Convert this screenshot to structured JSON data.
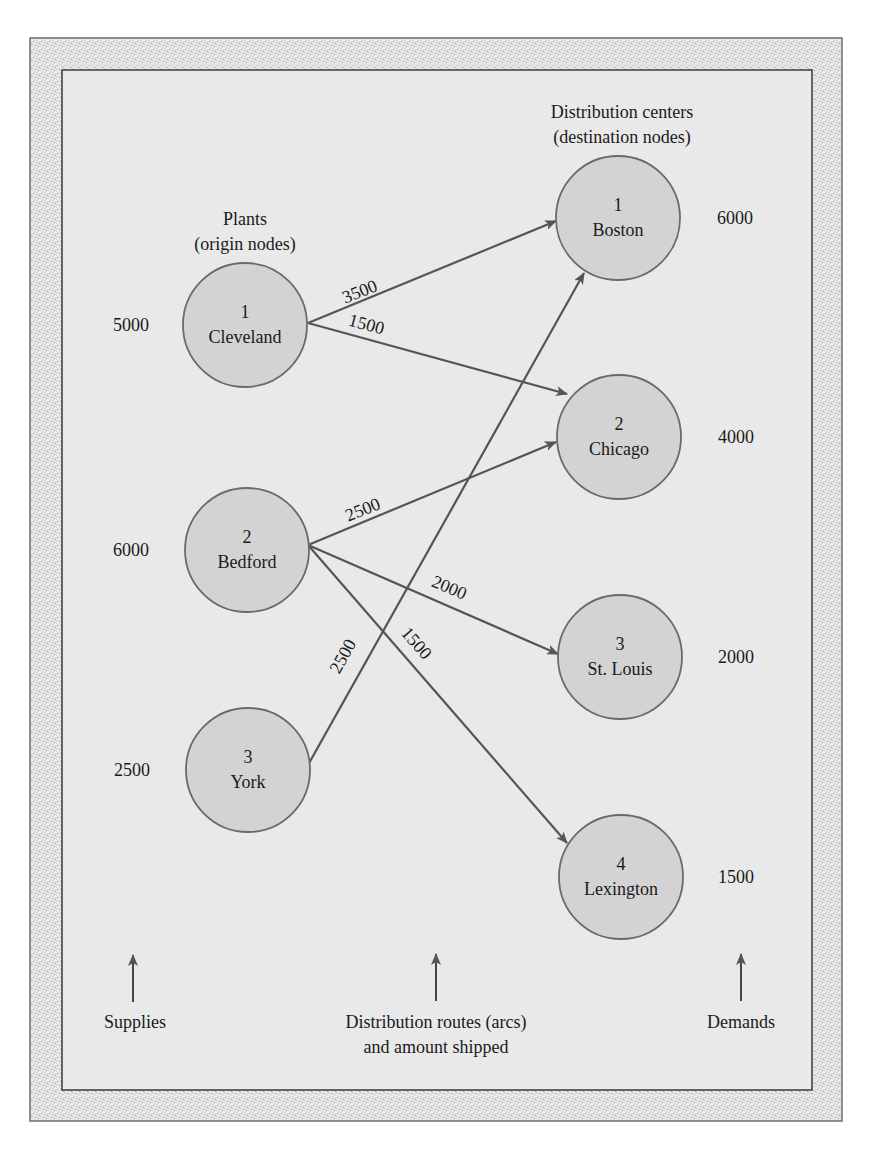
{
  "colors": {
    "frame_fill": "#dcdcdc",
    "panel_fill": "#e9e9e9",
    "node_fill": "#d3d3d3",
    "node_stroke": "#6a6a6a",
    "arc_color": "#555555",
    "text_color": "#1a1a1a"
  },
  "headers": {
    "plants_line1": "Plants",
    "plants_line2": "(origin nodes)",
    "dc_line1": "Distribution centers",
    "dc_line2": "(destination nodes)"
  },
  "origins": [
    {
      "id": "1",
      "name": "Cleveland",
      "supply": "5000"
    },
    {
      "id": "2",
      "name": "Bedford",
      "supply": "6000"
    },
    {
      "id": "3",
      "name": "York",
      "supply": "2500"
    }
  ],
  "destinations": [
    {
      "id": "1",
      "name": "Boston",
      "demand": "6000"
    },
    {
      "id": "2",
      "name": "Chicago",
      "demand": "4000"
    },
    {
      "id": "3",
      "name": "St. Louis",
      "demand": "2000"
    },
    {
      "id": "4",
      "name": "Lexington",
      "demand": "1500"
    }
  ],
  "arcs": [
    {
      "from": "Cleveland",
      "to": "Boston",
      "amount": "3500"
    },
    {
      "from": "Cleveland",
      "to": "Chicago",
      "amount": "1500"
    },
    {
      "from": "Bedford",
      "to": "Chicago",
      "amount": "2500"
    },
    {
      "from": "Bedford",
      "to": "St. Louis",
      "amount": "2000"
    },
    {
      "from": "Bedford",
      "to": "Lexington",
      "amount": "1500"
    },
    {
      "from": "York",
      "to": "Boston",
      "amount": "2500"
    }
  ],
  "footer": {
    "supplies": "Supplies",
    "routes_line1": "Distribution routes (arcs)",
    "routes_line2": "and amount shipped",
    "demands": "Demands"
  }
}
